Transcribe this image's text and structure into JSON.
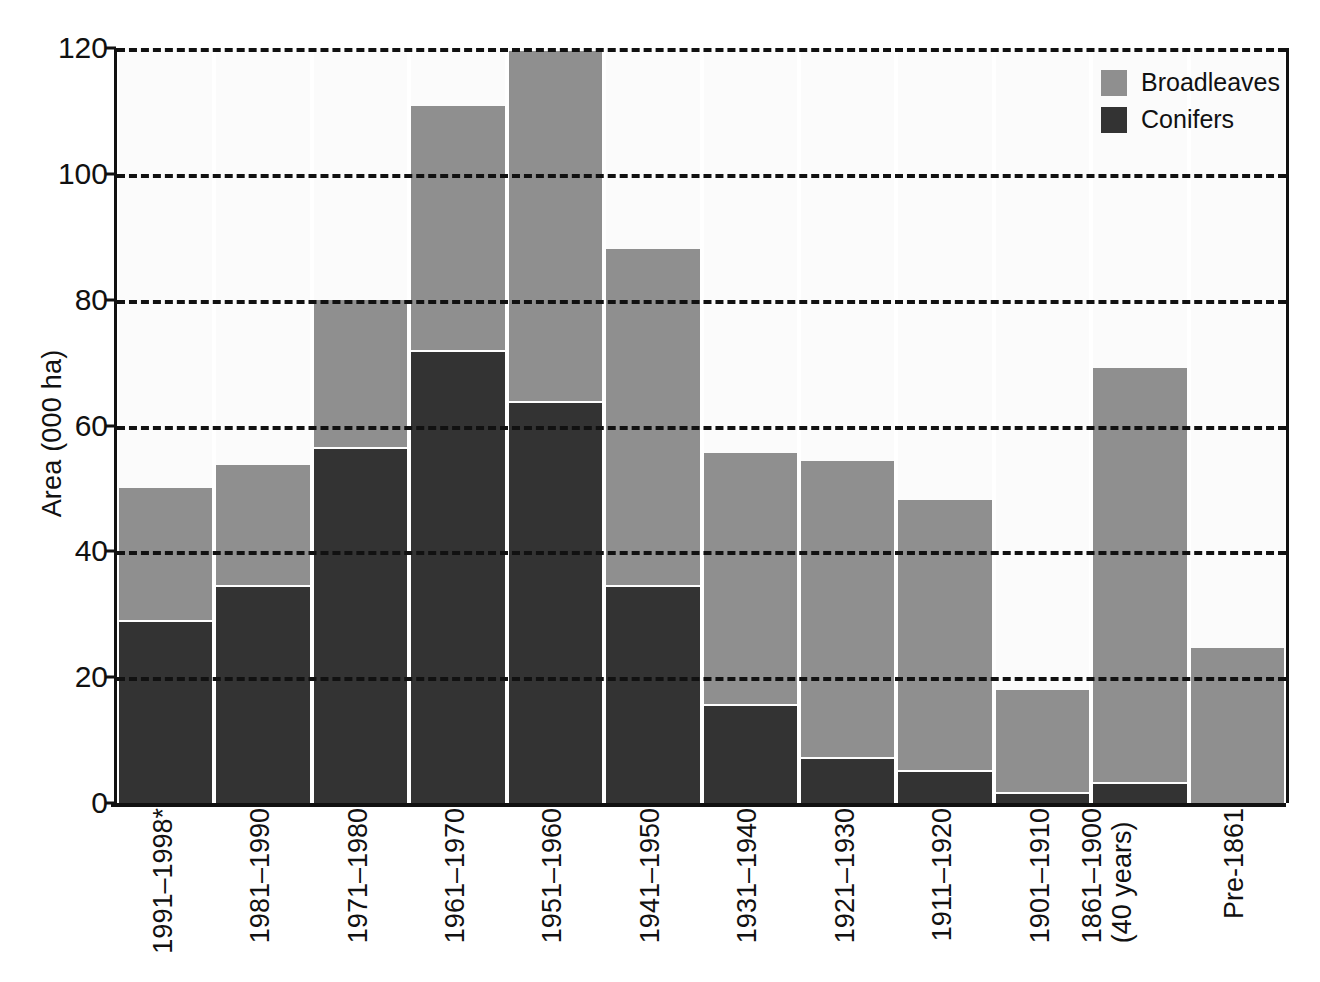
{
  "chart_data": {
    "type": "bar",
    "subtype": "stacked-vertical",
    "title": "",
    "xlabel": "",
    "ylabel": "Area (000 ha)",
    "ylim": [
      0,
      120
    ],
    "yticks": [
      0,
      20,
      40,
      60,
      80,
      100,
      120
    ],
    "ytick_labels": [
      "0",
      "20",
      "40",
      "60",
      "80",
      "100",
      "120"
    ],
    "grid": true,
    "grid_style": "dashed-horizontal",
    "legend_position": "top-right",
    "categories": [
      "1991–1998*",
      "1981–1990",
      "1971–1980",
      "1961–1970",
      "1951–1960",
      "1941–1950",
      "1931–1940",
      "1921–1930",
      "1911–1920",
      "1901–1910",
      "1861–1900\n(40 years)",
      "Pre-1861"
    ],
    "series": [
      {
        "name": "Conifers",
        "color": "#333333",
        "values": [
          28.7,
          34.3,
          56.2,
          71.7,
          63.5,
          34.4,
          15.4,
          7.0,
          4.9,
          1.5,
          3.1,
          0.0
        ]
      },
      {
        "name": "Broadleaves",
        "color": "#8f8f8f",
        "values": [
          21.3,
          19.4,
          23.8,
          39.1,
          56.0,
          53.7,
          40.3,
          47.3,
          43.2,
          16.5,
          66.0,
          24.6
        ]
      }
    ],
    "totals": [
      50.0,
      53.7,
      80.0,
      110.8,
      119.5,
      88.1,
      55.7,
      54.3,
      48.1,
      18.0,
      69.1,
      24.6
    ]
  },
  "legend": {
    "entries": [
      {
        "label": "Broadleaves",
        "color": "#8f8f8f"
      },
      {
        "label": "Conifers",
        "color": "#333333"
      }
    ]
  },
  "axes": {
    "y_title": "Area (000 ha)"
  },
  "x_labels": [
    {
      "line1": "1991–1998*",
      "line2": ""
    },
    {
      "line1": "1981–1990",
      "line2": ""
    },
    {
      "line1": "1971–1980",
      "line2": ""
    },
    {
      "line1": "1961–1970",
      "line2": ""
    },
    {
      "line1": "1951–1960",
      "line2": ""
    },
    {
      "line1": "1941–1950",
      "line2": ""
    },
    {
      "line1": "1931–1940",
      "line2": ""
    },
    {
      "line1": "1921–1930",
      "line2": ""
    },
    {
      "line1": "1911–1920",
      "line2": ""
    },
    {
      "line1": "1901–1910",
      "line2": ""
    },
    {
      "line1": "1861–1900",
      "line2": "(40 years)"
    },
    {
      "line1": "Pre-1861",
      "line2": ""
    }
  ],
  "colors": {
    "broadleaves": "#8f8f8f",
    "conifers": "#333333",
    "axis": "#111111",
    "plot_background": "#fbfbfb",
    "page_background": "#ffffff"
  }
}
